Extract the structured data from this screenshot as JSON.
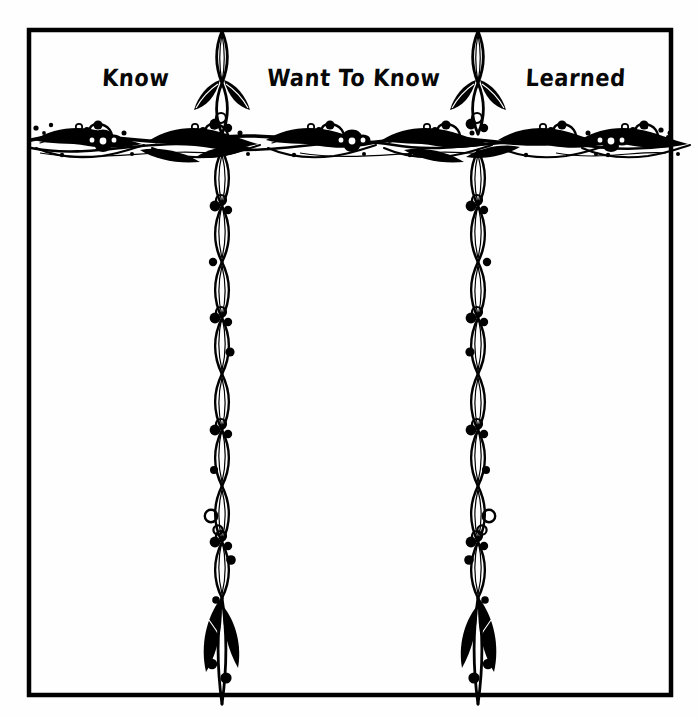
{
  "worksheet": {
    "kind": "kwl-chart",
    "columns": [
      {
        "id": "know",
        "label": "Know"
      },
      {
        "id": "want-to-know",
        "label": "Want To Know"
      },
      {
        "id": "learned",
        "label": "Learned"
      }
    ],
    "colors": {
      "ink": "#000000",
      "paper": "#fefefe",
      "border": "#000000"
    },
    "ornaments": {
      "horizontal_divider": "floral-vine-border",
      "vertical_divider_left": "twisting-vine-leaves-berries",
      "vertical_divider_right": "twisting-vine-leaves-berries"
    }
  }
}
